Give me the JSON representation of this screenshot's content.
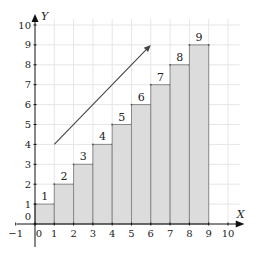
{
  "chart_data": {
    "type": "bar",
    "title": "",
    "xlabel": "X",
    "ylabel": "Y",
    "categories": [
      0,
      1,
      2,
      3,
      4,
      5,
      6,
      7,
      8
    ],
    "bar_width": 1,
    "values": [
      1,
      2,
      3,
      4,
      5,
      6,
      7,
      8,
      9
    ],
    "data_labels": [
      "1",
      "2",
      "3",
      "4",
      "5",
      "6",
      "7",
      "8",
      "9"
    ],
    "xlim": [
      -1,
      10
    ],
    "ylim": [
      0,
      10
    ],
    "x_ticks": [
      -1,
      0,
      1,
      2,
      3,
      4,
      5,
      6,
      7,
      8,
      9,
      10
    ],
    "y_ticks": [
      0,
      1,
      2,
      3,
      4,
      5,
      6,
      7,
      8,
      9,
      10
    ],
    "grid": true,
    "annotations": [
      {
        "type": "arrow",
        "from": [
          1,
          4
        ],
        "to": [
          6,
          9
        ]
      }
    ],
    "colors": {
      "bar_fill": "#dcdcdc",
      "bar_edge": "#8a8a8a",
      "grid": "#e6e6e6",
      "axis": "#111111",
      "arrow": "#444444"
    }
  }
}
